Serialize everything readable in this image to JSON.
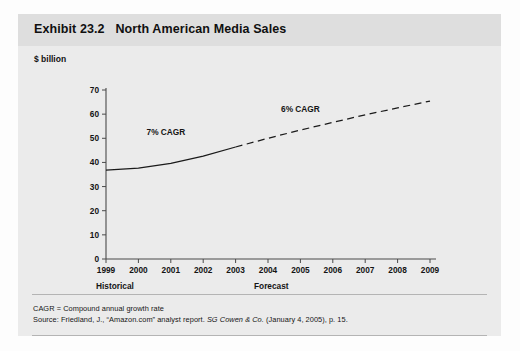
{
  "exhibit": {
    "title": "Exhibit 23.2   North American Media Sales",
    "y_axis_caption": "$ billion",
    "footnotes": {
      "cagr_definition": "CAGR = Compound annual growth rate",
      "source_prefix": "Source: Friedland, J., “Amazon.com” analyst report. ",
      "source_italic": "SG Cowen & Co.",
      "source_suffix": " (January 4, 2005), p. 15."
    },
    "period_labels": {
      "historical": "Historical",
      "forecast": "Forecast"
    }
  },
  "chart_data": {
    "type": "line",
    "title": "North American Media Sales",
    "xlabel": "",
    "ylabel": "$ billion",
    "ylim": [
      0,
      70
    ],
    "yticks": [
      0,
      10,
      20,
      30,
      40,
      50,
      60,
      70
    ],
    "ytick_labels": [
      "0",
      "10",
      "20",
      "30",
      "40",
      "50",
      "60",
      "70"
    ],
    "categories": [
      "1999",
      "2000",
      "2001",
      "2002",
      "2003",
      "2004",
      "2005",
      "2006",
      "2007",
      "2008",
      "2009"
    ],
    "x": [
      1999,
      2000,
      2001,
      2002,
      2003,
      2004,
      2005,
      2006,
      2007,
      2008,
      2009
    ],
    "grid": false,
    "legend": "none",
    "series": [
      {
        "name": "Historical",
        "style": "solid",
        "x": [
          1999,
          2000,
          2001,
          2002,
          2003
        ],
        "values": [
          36.8,
          37.6,
          39.6,
          42.6,
          46.4
        ]
      },
      {
        "name": "Forecast",
        "style": "dashed",
        "x": [
          2003,
          2004,
          2005,
          2006,
          2007,
          2008,
          2009
        ],
        "values": [
          46.4,
          50.0,
          53.4,
          56.6,
          59.7,
          62.6,
          65.4
        ]
      }
    ],
    "annotations": [
      {
        "text": "7% CAGR",
        "x": 2000.85,
        "y": 51.5
      },
      {
        "text": "6% CAGR",
        "x": 2005.0,
        "y": 61.0
      }
    ],
    "colors": {
      "line": "#1a1a1a",
      "axis": "#4a4a4a",
      "panel": "#e9e9e9",
      "title_band": "#dedede",
      "text": "#141414"
    }
  }
}
